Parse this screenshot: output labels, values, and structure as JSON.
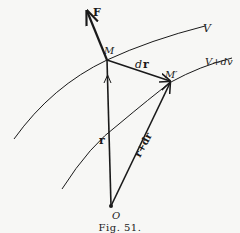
{
  "figure": {
    "caption": "Fig. 51.",
    "labels": {
      "force": "F",
      "point_m": "M",
      "point_m_prime": "M′",
      "origin": "O",
      "position_vector": "r",
      "displacement_d": "d",
      "displacement_r": "r",
      "position_plus": "r+dr",
      "surface_v": "V",
      "surface_v_dv": "V+dv"
    },
    "points": {
      "M": [
        107,
        60
      ],
      "M_prime": [
        171,
        82
      ],
      "O": [
        111,
        206
      ],
      "F_tip": [
        86,
        9
      ]
    },
    "colors": {
      "ink": "#1a1a1a",
      "paper": "#f7f7f5"
    }
  }
}
